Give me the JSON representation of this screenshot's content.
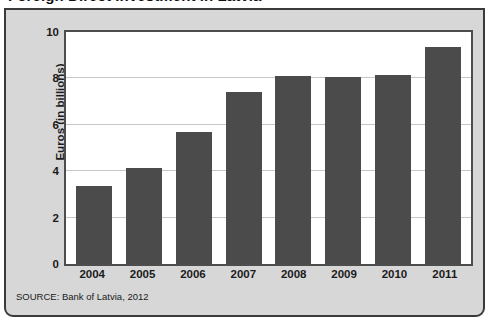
{
  "title": "Foreign Direct Investment in Latvia",
  "source_note": "SOURCE: Bank of Latvia, 2012",
  "colors": {
    "bar": "#4b4b4b",
    "panel_background": "#d7d7d7",
    "plot_background": "#ffffff",
    "border": "#3a3a3a",
    "gridline": "#c6c6c6",
    "text": "#1b1b1b"
  },
  "chart_data": {
    "type": "bar",
    "title": "Foreign Direct Investment in Latvia",
    "xlabel": "",
    "ylabel": "Euros (in billions)",
    "categories": [
      "2004",
      "2005",
      "2006",
      "2007",
      "2008",
      "2009",
      "2010",
      "2011"
    ],
    "values": [
      3.35,
      4.15,
      5.7,
      7.4,
      8.1,
      8.05,
      8.15,
      9.35
    ],
    "ylim": [
      0,
      10
    ],
    "yticks": [
      0,
      2,
      4,
      6,
      8,
      10
    ],
    "ytick_labels": [
      "0",
      "2",
      "4",
      "6",
      "8",
      "10"
    ],
    "grid": true,
    "legend": "none",
    "series": [
      {
        "name": "Foreign Direct Investment",
        "values": [
          3.35,
          4.15,
          5.7,
          7.4,
          8.1,
          8.05,
          8.15,
          9.35
        ]
      }
    ]
  }
}
